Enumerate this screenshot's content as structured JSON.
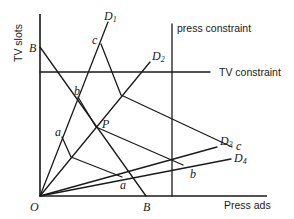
{
  "diagram": {
    "type": "media-allocation-constraint-diagram",
    "axes": {
      "y_label": "TV slots",
      "x_label": "Press ads",
      "origin_label": "O"
    },
    "constraints": {
      "press": "press constraint",
      "tv": "TV constraint"
    },
    "budget_line": {
      "y_intercept_label": "B",
      "x_intercept_label": "B"
    },
    "rays": [
      {
        "label": "D",
        "sub": "1"
      },
      {
        "label": "D",
        "sub": "2"
      },
      {
        "label": "D",
        "sub": "3"
      },
      {
        "label": "D",
        "sub": "4"
      }
    ],
    "point_labels": {
      "P": "P",
      "a_top": "a",
      "a_bottom": "a",
      "b_top": "b",
      "b_bottom": "b",
      "c_top": "c",
      "c_bottom": "c"
    },
    "colors": {
      "ink": "#1a1a1a",
      "background": "#ffffff"
    }
  }
}
